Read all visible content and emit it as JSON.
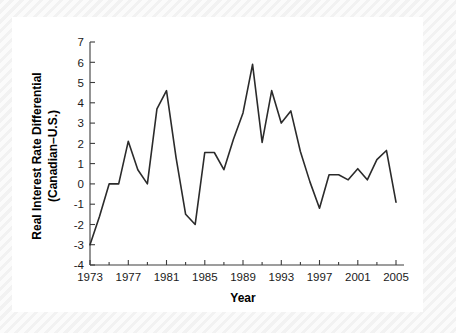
{
  "chart_data": {
    "type": "line",
    "title": "",
    "xlabel": "Year",
    "ylabel": "Real Interest Rate Differential (Canadian–U.S.)",
    "ylabel_line1": "Real Interest Rate Differential",
    "ylabel_line2": "(Canadian–U.S.)",
    "xlim": [
      1973,
      2005
    ],
    "ylim": [
      -4,
      7
    ],
    "grid": false,
    "legend": false,
    "line_color": "#2b2b2b",
    "axis_color": "#3c3c3c",
    "background_color": "#ffffff",
    "x_ticks": [
      1973,
      1977,
      1981,
      1985,
      1989,
      1993,
      1997,
      2001,
      2005
    ],
    "x_tick_labels": [
      "1973",
      "1977",
      "1981",
      "1985",
      "1989",
      "1993",
      "1997",
      "2001",
      "2005"
    ],
    "x_minor_ticks": [
      1975,
      1979,
      1983,
      1987,
      1991,
      1995,
      1999,
      2003
    ],
    "y_ticks": [
      -4,
      -3,
      -2,
      -1,
      0,
      1,
      2,
      3,
      4,
      5,
      6,
      7
    ],
    "y_tick_labels": [
      "-4",
      "-3",
      "-2",
      "-1",
      "0",
      "1",
      "2",
      "3",
      "4",
      "5",
      "6",
      "7"
    ],
    "x": [
      1973,
      1974,
      1975,
      1976,
      1977,
      1978,
      1979,
      1980,
      1981,
      1982,
      1983,
      1984,
      1985,
      1986,
      1987,
      1988,
      1989,
      1990,
      1991,
      1992,
      1993,
      1994,
      1995,
      1996,
      1997,
      1998,
      1999,
      2000,
      2001,
      2002,
      2003,
      2004,
      2005
    ],
    "values": [
      -3.0,
      -1.6,
      0.0,
      0.0,
      2.1,
      0.7,
      0.0,
      3.7,
      4.6,
      1.3,
      -1.5,
      -2.0,
      1.55,
      1.55,
      0.7,
      2.2,
      3.5,
      5.9,
      2.05,
      4.6,
      3.0,
      3.6,
      1.6,
      0.1,
      -1.2,
      0.45,
      0.45,
      0.2,
      0.75,
      0.2,
      1.2,
      1.65,
      -0.9
    ],
    "series": [
      {
        "name": "Real Interest Rate Differential (Canadian–U.S.)",
        "values": [
          -3.0,
          -1.6,
          0.0,
          0.0,
          2.1,
          0.7,
          0.0,
          3.7,
          4.6,
          1.3,
          -1.5,
          -2.0,
          1.55,
          1.55,
          0.7,
          2.2,
          3.5,
          5.9,
          2.05,
          4.6,
          3.0,
          3.6,
          1.6,
          0.1,
          -1.2,
          0.45,
          0.45,
          0.2,
          0.75,
          0.2,
          1.2,
          1.65,
          -0.9
        ]
      }
    ]
  }
}
